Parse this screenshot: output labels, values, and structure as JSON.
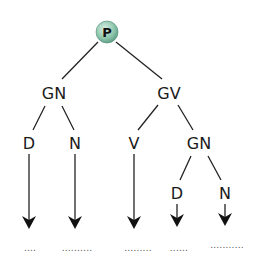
{
  "diagram": {
    "root": {
      "label": "P",
      "fill": "#8fc7ae"
    },
    "level1": {
      "left": "GN",
      "right": "GV"
    },
    "level2": {
      "d": "D",
      "n": "N",
      "v": "V",
      "gn": "GN"
    },
    "level3": {
      "d": "D",
      "n": "N"
    },
    "blanks": [
      "....",
      "..........",
      ".........",
      "......",
      "..........."
    ]
  }
}
